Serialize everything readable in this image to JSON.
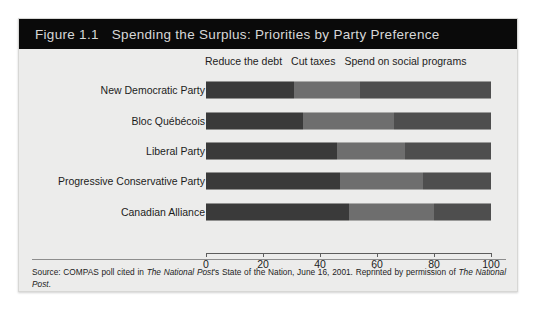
{
  "figure": {
    "number": "Figure 1.1",
    "title": "Spending the Surplus: Priorities by Party Preference"
  },
  "source": {
    "prefix": "Source: COMPAS poll cited in ",
    "publication_1": "The National Post",
    "middle": "'s State of the Nation, June 16, 2001. Reprinted by permission of ",
    "publication_2": "The National Post",
    "suffix": "."
  },
  "chart_data": {
    "type": "bar",
    "orientation": "horizontal",
    "stacked": true,
    "title": "Spending the Surplus: Priorities by Party Preference",
    "xlabel": "",
    "ylabel": "",
    "xlim": [
      0,
      100
    ],
    "xticks": [
      0,
      20,
      40,
      60,
      80,
      100
    ],
    "xticklabels": [
      "0",
      "20",
      "40",
      "60",
      "80",
      "100"
    ],
    "grid": false,
    "legend_position": "top",
    "categories": [
      "New Democratic Party",
      "Bloc Québécois",
      "Liberal Party",
      "Progressive Conservative Party",
      "Canadian Alliance"
    ],
    "series": [
      {
        "name": "Reduce the debt",
        "color": "#3a3a3a",
        "values": [
          31,
          34,
          46,
          47,
          50
        ]
      },
      {
        "name": "Cut taxes",
        "color": "#6e6e6e",
        "values": [
          23,
          32,
          24,
          29,
          30
        ]
      },
      {
        "name": "Spend on social programs",
        "color": "#4e4e4e",
        "values": [
          46,
          34,
          30,
          24,
          20
        ]
      }
    ]
  },
  "colors": {
    "titlebar_bg": "#0a0a0a",
    "titlebar_text": "#d8d8d8",
    "figure_bg": "#ececeb",
    "axis": "#5d5d5d"
  }
}
